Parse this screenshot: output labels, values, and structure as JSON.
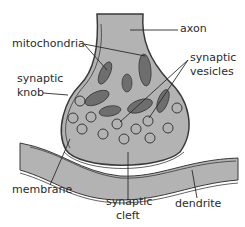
{
  "colors": {
    "fill": "#b3b3b3",
    "outline": "#3a3a3a",
    "mito": "#6e6e6e",
    "text": "#2a2a2a",
    "background": "#ffffff"
  },
  "labels": {
    "axon": "axon",
    "mitochondria": "mitochondria",
    "synaptic_vesicles_1": "synaptic",
    "synaptic_vesicles_2": "vesicles",
    "synaptic_knob_1": "synaptic",
    "synaptic_knob_2": "knob",
    "membrane": "membrane",
    "synaptic_cleft_1": "synaptic",
    "synaptic_cleft_2": "cleft",
    "dendrite": "dendrite"
  }
}
